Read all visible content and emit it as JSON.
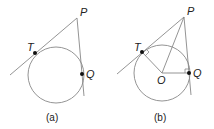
{
  "figure": {
    "panels": [
      {
        "id": "a",
        "caption": "(a)",
        "points": {
          "P": "P",
          "T": "T",
          "Q": "Q"
        },
        "description": "Circle with two tangent lines from external point P touching at T and Q"
      },
      {
        "id": "b",
        "caption": "(b)",
        "points": {
          "P": "P",
          "T": "T",
          "Q": "Q",
          "O": "O"
        },
        "description": "Same circle with center O; radii OT and OQ perpendicular to tangents; segment OP drawn"
      }
    ],
    "colors": {
      "line": "#888888",
      "point": "#111111",
      "text": "#222222"
    }
  }
}
